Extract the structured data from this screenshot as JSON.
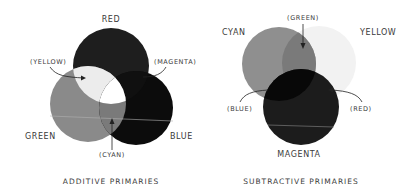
{
  "additive": {
    "caption": "ADDITIVE PRIMARIES",
    "primaries": {
      "red": {
        "label": "RED",
        "color": "#1e1e1e"
      },
      "green": {
        "label": "GREEN",
        "color": "#8a8a8a"
      },
      "blue": {
        "label": "BLUE",
        "color": "#0c0c0c"
      }
    },
    "overlaps": {
      "yellow": {
        "label": "(YELLOW)",
        "color": "#ececec"
      },
      "magenta": {
        "label": "(MAGENTA)",
        "color": "#101010"
      },
      "cyan": {
        "label": "(CYAN)",
        "color": "#7a7a7a"
      },
      "white": {
        "color": "#ffffff"
      }
    }
  },
  "subtractive": {
    "caption": "SUBTRACTIVE PRIMARIES",
    "primaries": {
      "cyan": {
        "label": "CYAN",
        "color": "#8f8f8f"
      },
      "yellow": {
        "label": "YELLOW",
        "color": "#f2f2f2"
      },
      "magenta": {
        "label": "MAGENTA",
        "color": "#1c1c1c"
      }
    },
    "overlaps": {
      "green": {
        "label": "(GREEN)",
        "color": "#7a7a7a"
      },
      "blue": {
        "label": "(BLUE)",
        "color": "#080808"
      },
      "red": {
        "label": "(RED)",
        "color": "#161616"
      }
    }
  }
}
